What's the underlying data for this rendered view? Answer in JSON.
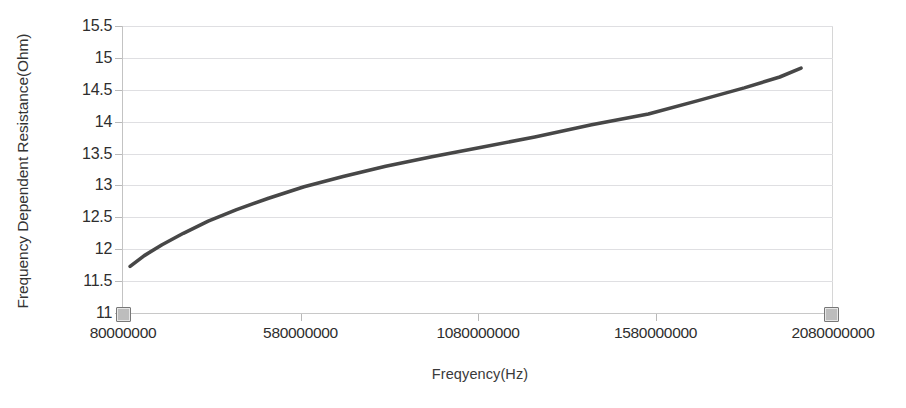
{
  "window": {
    "width": 906,
    "height": 408,
    "background": "#ffffff"
  },
  "title_remnant": "",
  "chart_data": {
    "type": "line",
    "title": "",
    "xlabel": "Freqyency(Hz)",
    "ylabel": "Frequency Dependent Resistance(Ohm)",
    "xlim": [
      80000000,
      2080000000
    ],
    "ylim": [
      11,
      15.5
    ],
    "grid": true,
    "legend": "none",
    "x_tick_labels": [
      "80000000",
      "580000000",
      "1080000000",
      "1580000000",
      "2080000000"
    ],
    "x_ticks": [
      80000000,
      580000000,
      1080000000,
      1580000000,
      2080000000
    ],
    "y_tick_labels": [
      "11",
      "11.5",
      "12",
      "12.5",
      "13",
      "13.5",
      "14",
      "14.5",
      "15",
      "15.5"
    ],
    "y_ticks": [
      11,
      11.5,
      12,
      12.5,
      13,
      13.5,
      14,
      14.5,
      15,
      15.5
    ],
    "series": [
      {
        "name": "Frequency Dependent Resistance",
        "color": "#474747",
        "line_width": 3.6,
        "x": [
          100000000,
          140000000,
          190000000,
          250000000,
          320000000,
          400000000,
          490000000,
          590000000,
          700000000,
          820000000,
          950000000,
          1090000000,
          1240000000,
          1400000000,
          1560000000,
          1700000000,
          1830000000,
          1930000000,
          1990000000
        ],
        "y": [
          11.73,
          11.9,
          12.07,
          12.25,
          12.44,
          12.62,
          12.8,
          12.98,
          13.14,
          13.3,
          13.45,
          13.6,
          13.76,
          13.95,
          14.12,
          14.33,
          14.53,
          14.7,
          14.84
        ]
      }
    ]
  },
  "selection": {
    "handle_left_name": "selection-handle-left",
    "handle_right_name": "selection-handle-right"
  }
}
